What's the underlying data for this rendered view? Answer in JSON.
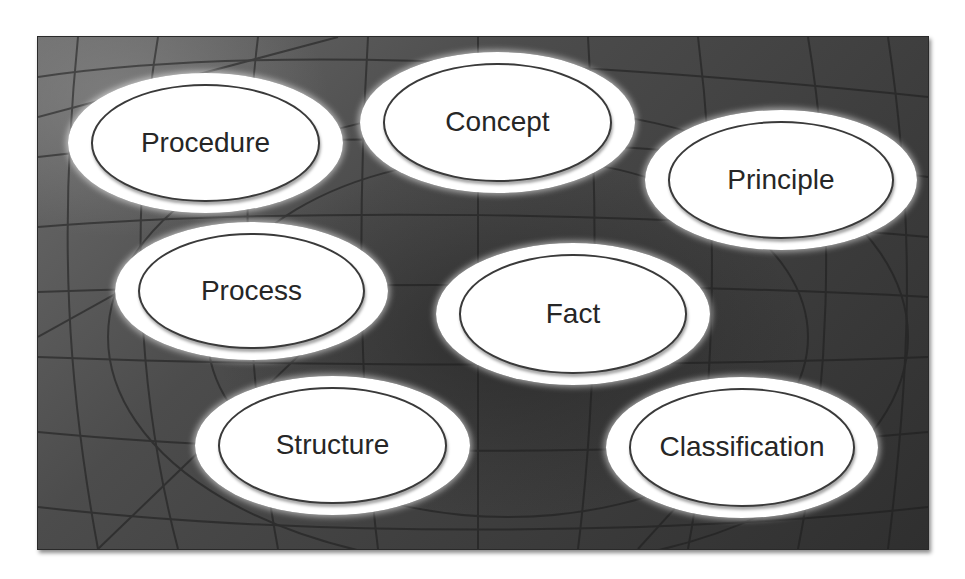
{
  "diagram": {
    "background": {
      "description": "dark gray textured panel with faint globe/grid lines",
      "colors": {
        "base": "#4a4a4a",
        "dark": "#2f2f2f",
        "light": "#6d6d6d",
        "lines": "#1e1e1e"
      }
    },
    "nodes": [
      {
        "id": "procedure",
        "label": "Procedure"
      },
      {
        "id": "concept",
        "label": "Concept"
      },
      {
        "id": "principle",
        "label": "Principle"
      },
      {
        "id": "process",
        "label": "Process"
      },
      {
        "id": "fact",
        "label": "Fact"
      },
      {
        "id": "structure",
        "label": "Structure"
      },
      {
        "id": "classification",
        "label": "Classification"
      }
    ],
    "node_style": {
      "fill": "#ffffff",
      "border": "#3a3a3a",
      "text": "#262626"
    }
  }
}
